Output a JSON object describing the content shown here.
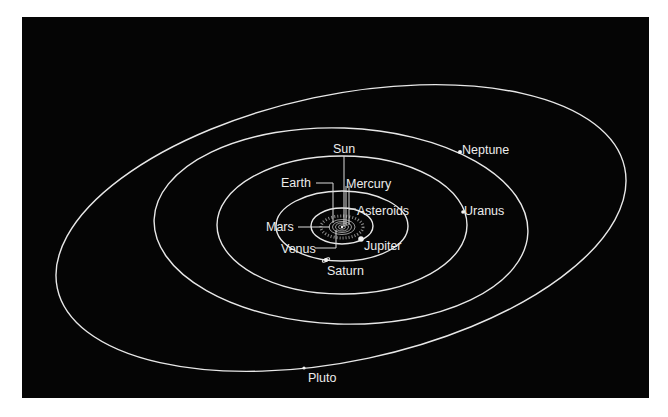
{
  "diagram": {
    "background_color": "#050505",
    "line_color": "#e8e8e8",
    "labels": {
      "sun": "Sun",
      "earth": "Earth",
      "mercury": "Mercury",
      "asteroids": "Asteroids",
      "mars": "Mars",
      "venus": "Venus",
      "jupiter": "Jupiter",
      "saturn": "Saturn",
      "uranus": "Uranus",
      "neptune": "Neptune",
      "pluto": "Pluto"
    },
    "bodies": [
      {
        "name": "Sun",
        "type": "star",
        "position": "center"
      },
      {
        "name": "Mercury",
        "type": "planet",
        "orbit_order": 1
      },
      {
        "name": "Venus",
        "type": "planet",
        "orbit_order": 2
      },
      {
        "name": "Earth",
        "type": "planet",
        "orbit_order": 3
      },
      {
        "name": "Mars",
        "type": "planet",
        "orbit_order": 4
      },
      {
        "name": "Asteroids",
        "type": "belt",
        "orbit_order": 5
      },
      {
        "name": "Jupiter",
        "type": "planet",
        "orbit_order": 6
      },
      {
        "name": "Saturn",
        "type": "planet",
        "orbit_order": 7
      },
      {
        "name": "Uranus",
        "type": "planet",
        "orbit_order": 8
      },
      {
        "name": "Neptune",
        "type": "planet",
        "orbit_order": 9
      },
      {
        "name": "Pluto",
        "type": "planet",
        "orbit_order": 10
      }
    ]
  }
}
